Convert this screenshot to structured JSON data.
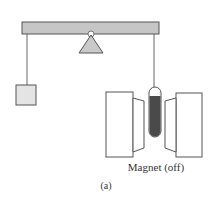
{
  "figure": {
    "magnet_label": "Magnet (off)",
    "caption": "(a)"
  },
  "colors": {
    "beam_fill": "#c6c6c6",
    "fulcrum_fill": "#c9c9c9",
    "block_fill": "#e4e4e4",
    "sample_fill": "#4a4a4a",
    "outline": "#555555"
  },
  "components": [
    "balance-beam",
    "fulcrum",
    "reference-weight",
    "sample-tube",
    "electromagnet-left",
    "electromagnet-right"
  ]
}
